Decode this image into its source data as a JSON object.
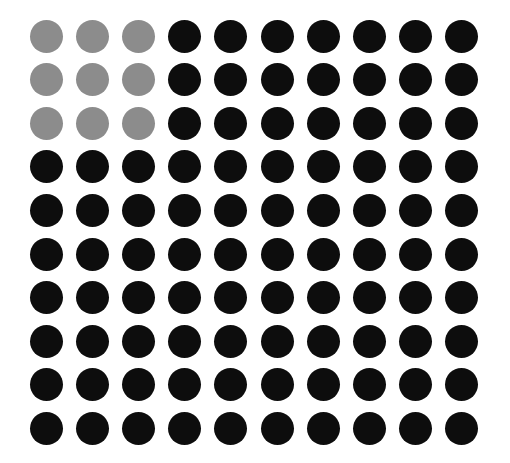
{
  "chart_data": {
    "type": "waffle",
    "title": "",
    "rows": 10,
    "cols": 10,
    "total": 100,
    "series": [
      {
        "name": "highlighted",
        "value": 9,
        "color": "#8c8c8c",
        "shape": "3x3 block top-left"
      },
      {
        "name": "rest",
        "value": 91,
        "color": "#0d0d0d"
      }
    ],
    "highlight_rows": 3,
    "highlight_cols": 3,
    "layout": {
      "first_center_x": 46,
      "first_center_y": 36,
      "step_x": 46.2,
      "step_y": 43.6,
      "diameter": 33
    },
    "legend": "none",
    "grid": false
  }
}
